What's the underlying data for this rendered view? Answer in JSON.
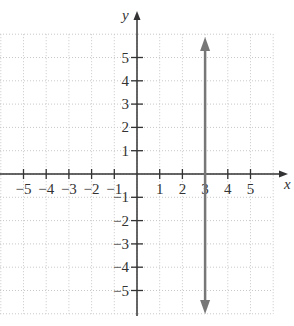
{
  "graph": {
    "x_axis_label": "x",
    "y_axis_label": "y",
    "x_ticks": [
      {
        "v": -5,
        "label": "−5"
      },
      {
        "v": -4,
        "label": "−4"
      },
      {
        "v": -3,
        "label": "−3"
      },
      {
        "v": -2,
        "label": "−2"
      },
      {
        "v": -1,
        "label": "−1"
      },
      {
        "v": 1,
        "label": "1"
      },
      {
        "v": 2,
        "label": "2"
      },
      {
        "v": 3,
        "label": "3"
      },
      {
        "v": 4,
        "label": "4"
      },
      {
        "v": 5,
        "label": "5"
      }
    ],
    "y_ticks": [
      {
        "v": 5,
        "label": "5"
      },
      {
        "v": 4,
        "label": "4"
      },
      {
        "v": 3,
        "label": "3"
      },
      {
        "v": 2,
        "label": "2"
      },
      {
        "v": 1,
        "label": "1"
      },
      {
        "v": -1,
        "label": "−1"
      },
      {
        "v": -2,
        "label": "−2"
      },
      {
        "v": -3,
        "label": "−3"
      },
      {
        "v": -4,
        "label": "−4"
      },
      {
        "v": -5,
        "label": "−5"
      }
    ],
    "grid_range": {
      "xmin": -6,
      "xmax": 6,
      "ymin": -6,
      "ymax": 6
    },
    "plotted_line": {
      "equation": "x = 3",
      "x": 3,
      "color": "#777777"
    },
    "axis_color": "#333333",
    "grid_color": "#c8c8c8"
  }
}
